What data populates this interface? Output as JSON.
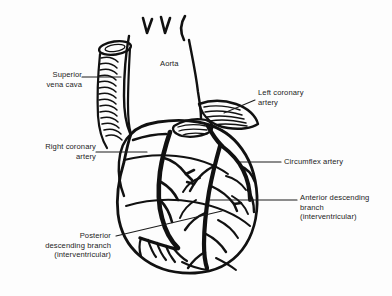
{
  "figure": {
    "background_color": "#fdfdfd",
    "ink_color": "#111111",
    "text_color": "#232323"
  },
  "labels": {
    "superior_vena_cava": "Superior\nvena cava",
    "aorta": "Aorta",
    "left_coronary_artery": "Left coronary\nartery",
    "right_coronary_artery": "Right coronary\nartery",
    "circumflex_artery": "Circumflex artery",
    "anterior_descending_branch": "Anterior descending\nbranch\n(interventricular)",
    "posterior_descending_branch": "Posterior\ndescending branch\n(interventricular)"
  },
  "structures": [
    {
      "name": "aortic-arch",
      "description": "Aortic arch with three branch vessels at top"
    },
    {
      "name": "superior-vena-cava",
      "description": "Ribbed vessel entering right atrium from upper left"
    },
    {
      "name": "left-atrial-appendage",
      "description": "Striated flap at upper right of ventricular mass"
    },
    {
      "name": "right-coronary-artery",
      "description": "Vessel in right atrioventricular groove"
    },
    {
      "name": "left-coronary-artery",
      "description": "Short trunk beneath left atrial appendage"
    },
    {
      "name": "circumflex-artery",
      "description": "Branch curving into left atrioventricular groove"
    },
    {
      "name": "anterior-descending-branch",
      "description": "Vessel running down anterior interventricular groove"
    },
    {
      "name": "posterior-descending-branch",
      "description": "Vessel at inferior margin near apex"
    },
    {
      "name": "ventricular-mass",
      "description": "Rounded heart body with apex at lower centre"
    }
  ]
}
